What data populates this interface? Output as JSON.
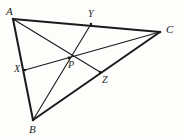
{
  "figure": {
    "kind": "geometry-diagram",
    "background_color": "#fdfdfc",
    "stroke_color": "#1a1a1a",
    "outer_stroke_width": 2.0,
    "inner_stroke_width": 1.0,
    "width": 185,
    "height": 138
  },
  "points": {
    "A": {
      "label": "A",
      "x": 13,
      "y": 19,
      "label_x": 6,
      "label_y": 6
    },
    "B": {
      "label": "B",
      "x": 33,
      "y": 120,
      "label_x": 29,
      "label_y": 124
    },
    "C": {
      "label": "C",
      "x": 160,
      "y": 32,
      "label_x": 166,
      "label_y": 24
    },
    "X": {
      "label": "X",
      "x": 25,
      "y": 70,
      "label_x": 14,
      "label_y": 64
    },
    "Y": {
      "label": "Y",
      "x": 91,
      "y": 24,
      "label_x": 88,
      "label_y": 9
    },
    "Z": {
      "label": "Z",
      "x": 100,
      "y": 72,
      "label_x": 102,
      "label_y": 75
    },
    "P": {
      "label": "P",
      "x": 69,
      "y": 58,
      "label_x": 68,
      "label_y": 60
    }
  },
  "segments": {
    "outer": [
      {
        "name": "side-AB",
        "from": "A",
        "to": "B"
      },
      {
        "name": "side-AC",
        "from": "A",
        "to": "C"
      },
      {
        "name": "side-BC",
        "from": "B",
        "to": "C"
      }
    ],
    "cevians": [
      {
        "name": "cevian-AZ",
        "from": "A",
        "to": "Z"
      },
      {
        "name": "cevian-BY",
        "from": "B",
        "to": "Y"
      },
      {
        "name": "cevian-CX",
        "from": "C",
        "to": "X"
      }
    ]
  },
  "labels": {
    "A": "A",
    "B": "B",
    "C": "C",
    "X": "X",
    "Y": "Y",
    "Z": "Z",
    "P": "P"
  }
}
